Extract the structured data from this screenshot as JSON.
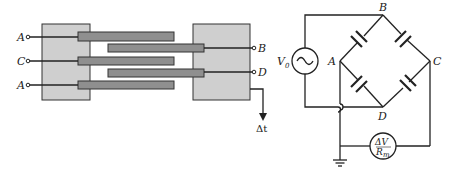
{
  "left_diagram": {
    "title": "interdigitated capacitor structure",
    "terminals_left": [
      {
        "label": "A"
      },
      {
        "label": "C"
      },
      {
        "label": "A"
      }
    ],
    "terminals_right": [
      {
        "label": "B"
      },
      {
        "label": "D"
      }
    ],
    "output_label": "Δt",
    "colors": {
      "block": "#cfcfcf",
      "bar": "#8f8f8f",
      "line": "#222222"
    }
  },
  "right_diagram": {
    "title": "capacitance bridge circuit",
    "nodes": {
      "B": "B",
      "A": "A",
      "C": "C",
      "D": "D"
    },
    "source": {
      "label": "V",
      "subscript": "0",
      "symbol": "~"
    },
    "meter": {
      "top": "ΔV",
      "bottom": "R",
      "bottom_sub": "m"
    },
    "ground": "ground"
  }
}
